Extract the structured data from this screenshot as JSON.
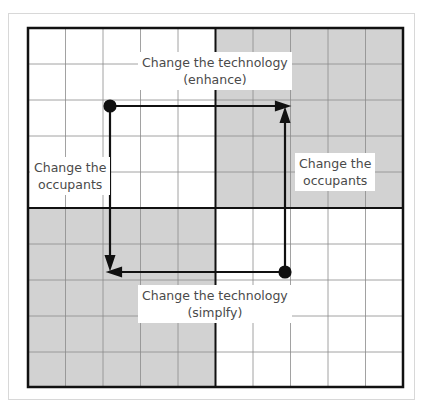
{
  "diagram": {
    "grid": {
      "rows": 10,
      "cols": 10,
      "shaded_quadrants": [
        "top-right",
        "bottom-left"
      ]
    },
    "colors": {
      "shade": "#d2d2d2",
      "line": "#111111",
      "grid": "#888888",
      "text": "#4a4a4a"
    },
    "labels": {
      "top": {
        "line1": "Change the technology",
        "line2": "(enhance)"
      },
      "left": {
        "line1": "Change the",
        "line2": "occupants"
      },
      "right": {
        "line1": "Change the",
        "line2": "occupants"
      },
      "bottom": {
        "line1": "Change the technology",
        "line2": "(simplfy)"
      }
    }
  }
}
